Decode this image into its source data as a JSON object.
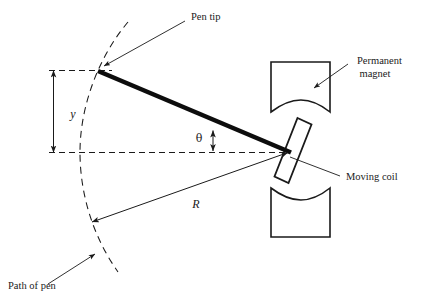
{
  "diagram": {
    "background_color": "#ffffff",
    "line_color": "#1a1a1a",
    "labels": {
      "pen_tip": "Pen tip",
      "permanent_magnet_line1": "Permanent",
      "permanent_magnet_line2": "magnet",
      "moving_coil": "Moving coil",
      "path_of_pen": "Path of pen",
      "displacement_y": "y",
      "radius_R": "R",
      "angle_theta": "θ"
    },
    "parts": [
      {
        "name": "permanent-magnet-top",
        "label": "Permanent magnet"
      },
      {
        "name": "permanent-magnet-bottom",
        "label": "Permanent magnet"
      },
      {
        "name": "moving-coil",
        "label": "Moving coil"
      },
      {
        "name": "pen-arm",
        "label": "Pen arm"
      },
      {
        "name": "pen-path-arc",
        "label": "Path of pen"
      }
    ],
    "dimensions": [
      {
        "name": "y",
        "symbol": "y",
        "description": "Vertical pen displacement"
      },
      {
        "name": "R",
        "symbol": "R",
        "description": "Radius from pivot to pen path"
      },
      {
        "name": "theta",
        "symbol": "θ",
        "description": "Angular deflection of coil"
      }
    ]
  }
}
